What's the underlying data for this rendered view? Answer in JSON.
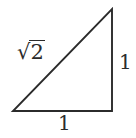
{
  "figure": {
    "type": "right-triangle-diagram",
    "background_color": "#ffffff",
    "stroke_color": "#2b2b2b",
    "text_color": "#2b2b2b",
    "title": "",
    "vertices": {
      "bottom_left": [
        13,
        111
      ],
      "bottom_right": [
        112,
        111
      ],
      "top_right": [
        112,
        9
      ]
    },
    "labels": {
      "hypotenuse": {
        "radical_sign": "√",
        "radicand": "2",
        "full_text": "√2"
      },
      "vertical_leg": "1",
      "horizontal_leg": "1"
    }
  }
}
